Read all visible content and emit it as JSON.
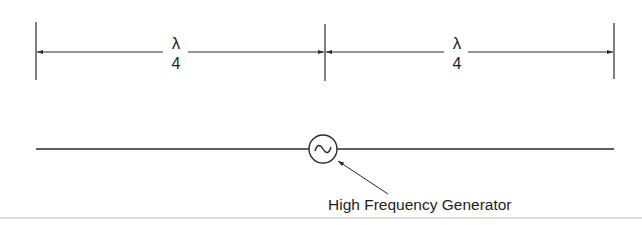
{
  "diagram": {
    "dimension_left": {
      "numerator": "λ",
      "denominator": "4"
    },
    "dimension_right": {
      "numerator": "λ",
      "denominator": "4"
    },
    "generator_symbol": "~",
    "callout_label": "High Frequency Generator"
  },
  "colors": {
    "line": "#2a2a2a",
    "text": "#1e1e1e",
    "rule": "#bdbdbd",
    "background": "#ffffff"
  }
}
